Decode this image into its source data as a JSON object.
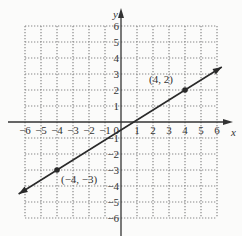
{
  "chart_data": {
    "type": "line",
    "title": "",
    "xlabel": "x",
    "ylabel": "y",
    "xlim": [
      -6,
      6
    ],
    "ylim": [
      -6,
      6
    ],
    "grid": true,
    "x_ticks": [
      -6,
      -5,
      -4,
      -3,
      -2,
      -1,
      1,
      2,
      3,
      4,
      5,
      6
    ],
    "y_ticks": [
      -6,
      -5,
      -4,
      -3,
      -2,
      -1,
      1,
      2,
      3,
      4,
      5,
      6
    ],
    "origin_label": "0",
    "series": [
      {
        "name": "line",
        "equation": "y = (5/8)x - 1/2",
        "x": [
          -4,
          4
        ],
        "y": [
          -3,
          2
        ],
        "arrows_both_ends": true
      }
    ],
    "points": [
      {
        "x": 4,
        "y": 2,
        "label": "(4, 2)"
      },
      {
        "x": -4,
        "y": -3,
        "label": "(−4, −3)"
      }
    ]
  },
  "colors": {
    "line": "#2a2a2a",
    "grid": "#888888",
    "axis": "#333333",
    "background": "#fbfbfa"
  }
}
